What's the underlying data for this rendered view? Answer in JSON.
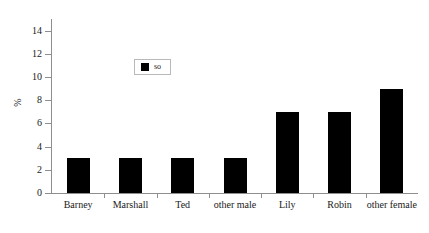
{
  "chart_data": {
    "type": "bar",
    "title": "",
    "subtitle": "",
    "xlabel": "",
    "ylabel": "%",
    "categories": [
      "Barney",
      "Marshall",
      "Ted",
      "other male",
      "Lily",
      "Robin",
      "other female"
    ],
    "values": [
      3,
      3,
      3,
      3,
      7,
      7,
      9
    ],
    "series": [
      {
        "name": "so",
        "values": [
          3,
          3,
          3,
          3,
          7,
          7,
          9
        ],
        "color": "#000000"
      }
    ],
    "ylim": [
      0,
      15
    ],
    "yticks": [
      0,
      2,
      4,
      6,
      8,
      10,
      12,
      14
    ],
    "ytick_labels": [
      "0",
      "2",
      "4",
      "6",
      "8",
      "10",
      "12",
      "14"
    ],
    "grid": false,
    "legend": {
      "position": "upper-center-left",
      "entries": [
        {
          "label": "so",
          "color": "#000000",
          "marker": "square"
        }
      ]
    },
    "colors": {
      "bar": "#000000",
      "axis": "#8e8e8e",
      "text": "#1a1a1a",
      "background": "#ffffff",
      "legend_border": "#b9b9b9"
    }
  }
}
